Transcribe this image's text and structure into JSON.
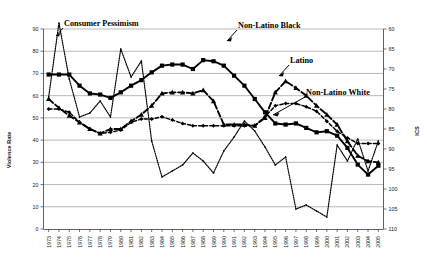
{
  "chart_data": {
    "type": "line",
    "title": "",
    "xlabel": "",
    "ylabel": "Violence Rate",
    "y2label": "ICS",
    "ylim": [
      0,
      90
    ],
    "y2lim": [
      110,
      60
    ],
    "y_ticks": [
      0,
      10,
      20,
      30,
      40,
      50,
      60,
      70,
      80,
      90
    ],
    "y2_ticks": [
      60,
      65,
      70,
      75,
      80,
      85,
      90,
      95,
      100,
      105,
      110
    ],
    "grid": true,
    "legend_position": "inline-annotations",
    "x": [
      1973,
      1974,
      1975,
      1976,
      1977,
      1978,
      1979,
      1980,
      1981,
      1982,
      1983,
      1984,
      1985,
      1986,
      1987,
      1988,
      1989,
      1990,
      1991,
      1992,
      1993,
      1994,
      1995,
      1996,
      1997,
      1998,
      1999,
      2000,
      2001,
      2002,
      2003,
      2004,
      2005
    ],
    "series": [
      {
        "name": "Non-Latino Black",
        "axis": "left",
        "style": "solid-square",
        "values": [
          69.5,
          69.5,
          69.5,
          64.5,
          61.0,
          60.5,
          59.0,
          61.5,
          64.5,
          67.0,
          70.5,
          73.5,
          74.0,
          74.0,
          72.0,
          76.0,
          75.5,
          73.5,
          69.0,
          64.5,
          58.5,
          52.5,
          47.5,
          47.0,
          47.5,
          45.5,
          43.5,
          44.0,
          42.0,
          36.5,
          29.0,
          24.5,
          28.5
        ]
      },
      {
        "name": "Latino",
        "axis": "left",
        "style": "dashed-triangle",
        "values": [
          58.5,
          54.5,
          51.0,
          48.0,
          45.0,
          43.0,
          45.0,
          45.0,
          48.5,
          51.5,
          55.5,
          61.0,
          61.5,
          61.5,
          61.0,
          62.5,
          57.5,
          47.0,
          47.0,
          47.0,
          46.5,
          50.0,
          61.5,
          66.5,
          63.5,
          60.0,
          55.5,
          51.5,
          47.0,
          39.5,
          33.0,
          30.5,
          30.0
        ]
      },
      {
        "name": "Non-Latino White",
        "axis": "left",
        "style": "dotted-diamond",
        "values": [
          54.0,
          54.0,
          52.5,
          48.0,
          45.0,
          43.0,
          43.5,
          44.5,
          48.0,
          49.5,
          49.5,
          50.5,
          49.0,
          47.5,
          46.5,
          46.5,
          46.5,
          46.5,
          46.5,
          46.5,
          46.5,
          50.5,
          55.5,
          56.5,
          56.5,
          55.0,
          53.0,
          48.5,
          44.0,
          41.0,
          38.5,
          38.5,
          38.5
        ]
      },
      {
        "name": "Consumer Pessimism",
        "axis": "right",
        "style": "fine-dotted",
        "values": [
          77.0,
          58.5,
          72.5,
          82.0,
          81.0,
          78.0,
          82.0,
          65.0,
          72.0,
          68.0,
          88.0,
          97.0,
          95.5,
          94.0,
          91.0,
          93.0,
          96.0,
          90.5,
          87.0,
          83.0,
          85.5,
          89.5,
          94.0,
          92.0,
          105.0,
          104.0,
          105.5,
          107.0,
          89.0,
          93.0,
          87.5,
          95.5,
          88.0
        ]
      }
    ],
    "annotations": [
      {
        "text": "Consumer Pessimism",
        "target": "Consumer Pessimism"
      },
      {
        "text": "Non-Latino Black",
        "target": "Non-Latino Black"
      },
      {
        "text": "Latino",
        "target": "Latino"
      },
      {
        "text": "Non-Latino White",
        "target": "Non-Latino White"
      }
    ]
  },
  "axes": {
    "left_title": "Violence Rate",
    "right_title": "ICS",
    "left_ticks": [
      "0",
      "10",
      "20",
      "30",
      "40",
      "50",
      "60",
      "70",
      "80",
      "90"
    ],
    "right_ticks": [
      "60",
      "65",
      "70",
      "75",
      "80",
      "85",
      "90",
      "95",
      "100",
      "105",
      "110"
    ],
    "x_ticks": [
      "1973",
      "1974",
      "1975",
      "1976",
      "1977",
      "1978",
      "1979",
      "1980",
      "1981",
      "1982",
      "1983",
      "1984",
      "1985",
      "1986",
      "1987",
      "1988",
      "1989",
      "1990",
      "1991",
      "1992",
      "1993",
      "1994",
      "1995",
      "1996",
      "1997",
      "1998",
      "1999",
      "2000",
      "2001",
      "2002",
      "2003",
      "2004",
      "2005"
    ]
  },
  "labels": {
    "consumer_pessimism": "Consumer Pessimism",
    "non_latino_black": "Non-Latino Black",
    "latino": "Latino",
    "non_latino_white": "Non-Latino White"
  },
  "colors": {
    "plot_background": "#ffffff",
    "grid": "#8a8a8a",
    "axis": "#3a3a3a",
    "series_line": "#000000"
  }
}
